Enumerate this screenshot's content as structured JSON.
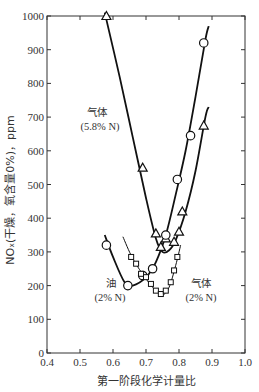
{
  "chart_data": {
    "type": "line",
    "title": "",
    "xlabel": "第一阶段化学计量比",
    "ylabel": "NOx(干燥，氧含量0%)，ppm",
    "xlim": [
      0.4,
      1.0
    ],
    "ylim": [
      0,
      1000
    ],
    "xticks": [
      "0.4",
      "0.5",
      "0.6",
      "0.7",
      "0.8",
      "0.9",
      "1.0"
    ],
    "yticks": [
      "0",
      "100",
      "200",
      "300",
      "400",
      "500",
      "600",
      "700",
      "800",
      "900",
      "1000"
    ],
    "grid": false,
    "legend": "none (inline annotations)",
    "series": [
      {
        "name": "气体 (5.8% N)",
        "marker": "triangle",
        "points": [
          [
            0.58,
            1000
          ],
          [
            0.69,
            550
          ],
          [
            0.73,
            355
          ],
          [
            0.745,
            315
          ],
          [
            0.76,
            340
          ],
          [
            0.785,
            330
          ],
          [
            0.8,
            360
          ],
          [
            0.81,
            420
          ],
          [
            0.875,
            675
          ]
        ],
        "curve": [
          [
            0.575,
            1010
          ],
          [
            0.62,
            820
          ],
          [
            0.66,
            640
          ],
          [
            0.7,
            460
          ],
          [
            0.73,
            340
          ],
          [
            0.75,
            300
          ],
          [
            0.77,
            305
          ],
          [
            0.79,
            335
          ],
          [
            0.82,
            420
          ],
          [
            0.85,
            540
          ],
          [
            0.88,
            700
          ],
          [
            0.89,
            730
          ]
        ]
      },
      {
        "name": "油 (2% N)",
        "marker": "circle",
        "points": [
          [
            0.58,
            320
          ],
          [
            0.645,
            200
          ],
          [
            0.69,
            230
          ],
          [
            0.72,
            250
          ],
          [
            0.76,
            350
          ],
          [
            0.795,
            515
          ],
          [
            0.835,
            645
          ],
          [
            0.875,
            920
          ]
        ],
        "curve": [
          [
            0.575,
            350
          ],
          [
            0.6,
            285
          ],
          [
            0.635,
            210
          ],
          [
            0.66,
            200
          ],
          [
            0.7,
            225
          ],
          [
            0.73,
            270
          ],
          [
            0.76,
            350
          ],
          [
            0.79,
            470
          ],
          [
            0.82,
            600
          ],
          [
            0.85,
            760
          ],
          [
            0.88,
            930
          ],
          [
            0.89,
            970
          ]
        ]
      },
      {
        "name": "气体 (2% N)",
        "marker": "square",
        "points": [
          [
            0.655,
            285
          ],
          [
            0.67,
            265
          ],
          [
            0.685,
            235
          ],
          [
            0.7,
            225
          ],
          [
            0.715,
            205
          ],
          [
            0.73,
            185
          ],
          [
            0.745,
            175
          ],
          [
            0.76,
            185
          ],
          [
            0.775,
            210
          ],
          [
            0.785,
            245
          ],
          [
            0.795,
            285
          ]
        ],
        "curve": [
          [
            0.63,
            345
          ],
          [
            0.66,
            280
          ],
          [
            0.7,
            220
          ],
          [
            0.73,
            185
          ],
          [
            0.75,
            172
          ],
          [
            0.77,
            195
          ],
          [
            0.79,
            260
          ],
          [
            0.805,
            320
          ]
        ]
      }
    ],
    "annotations": [
      {
        "text_line1": "气体",
        "text_line2": "(5.8% N)"
      },
      {
        "text_line1": "油",
        "text_line2": "(2% N)"
      },
      {
        "text_line1": "气体",
        "text_line2": "(2% N)"
      }
    ]
  },
  "labels": {
    "xlabel": "第一阶段化学计量比",
    "ylabel": "NOₓ(干燥，氧含量0%)，ppm",
    "gas58_line1": "气体",
    "gas58_line2": "(5.8% N)",
    "oil_line1": "油",
    "oil_line2": "(2% N)",
    "gas2_line1": "气体",
    "gas2_line2": "(2% N)"
  }
}
